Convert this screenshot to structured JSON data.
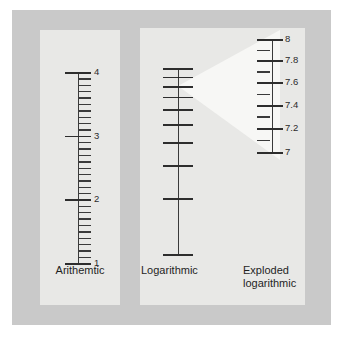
{
  "figure": {
    "background_color": "#ffffff",
    "panel_background": "#c9c9c9",
    "card_background": "#e8e8e6",
    "ink_color": "#3a3a3a",
    "wedge_color": "#f7f7f5"
  },
  "captions": {
    "arithmetic": "Arithemtic",
    "logarithmic": "Logarithmic",
    "exploded": "Exploded\nlogarithmic"
  },
  "chart_data": [
    {
      "type": "scale",
      "name": "arithmetic",
      "title": "Arithemtic",
      "scale_type": "linear",
      "range": [
        1,
        4
      ],
      "major_ticks": [
        1,
        2,
        3,
        4
      ],
      "major_labels": [
        "1",
        "2",
        "3",
        "4"
      ],
      "minor_tick_step": 0.1,
      "minor_ticks": [
        1.1,
        1.2,
        1.3,
        1.4,
        1.5,
        1.6,
        1.7,
        1.8,
        1.9,
        2.1,
        2.2,
        2.3,
        2.4,
        2.5,
        2.6,
        2.7,
        2.8,
        2.9,
        3.1,
        3.2,
        3.3,
        3.4,
        3.5,
        3.6,
        3.7,
        3.8,
        3.9
      ],
      "orientation": "vertical",
      "label_side": "right"
    },
    {
      "type": "scale",
      "name": "logarithmic",
      "title": "Logarithmic",
      "scale_type": "log10",
      "range": [
        1,
        10
      ],
      "major_ticks": [
        1,
        2,
        3,
        4,
        5,
        6,
        7,
        8,
        9,
        10
      ],
      "major_labels": [
        "1",
        "2",
        "3",
        "4",
        "5",
        "6",
        "7",
        "8",
        "9",
        "10"
      ],
      "minor_ticks": [],
      "orientation": "vertical",
      "label_side": "left"
    },
    {
      "type": "scale",
      "name": "exploded-logarithmic",
      "title": "Exploded logarithmic",
      "scale_type": "log10",
      "range": [
        7,
        8
      ],
      "major_ticks": [
        7,
        7.2,
        7.4,
        7.6,
        7.8,
        8
      ],
      "major_labels": [
        "7",
        "7.2",
        "7.4",
        "7.6",
        "7.8",
        "8"
      ],
      "minor_ticks": [
        7.1,
        7.3,
        7.5,
        7.7,
        7.9
      ],
      "orientation": "vertical",
      "label_side": "right",
      "source_region": [
        7,
        8
      ],
      "source_scale": "logarithmic"
    }
  ]
}
